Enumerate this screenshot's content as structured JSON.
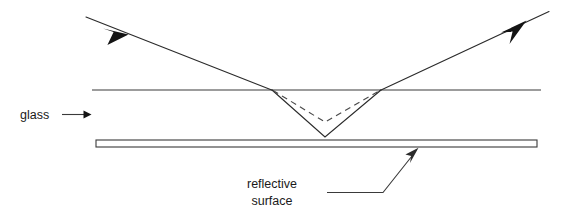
{
  "figure": {
    "background_color": "#ffffff",
    "ink_color": "#2b2b2b",
    "width": 576,
    "height": 223
  },
  "labels": {
    "glass": {
      "text": "glass",
      "x": 20,
      "y": 119,
      "pointer_icon": "arrow-right-icon"
    },
    "reflective_surface": {
      "line1": "reflective",
      "line2": "surface",
      "x": 272,
      "y1": 188,
      "y2": 204,
      "pointer_icon": "arrow-up-right-icon"
    }
  },
  "geometry": {
    "glass_top_surface": {
      "x1": 92,
      "y1": 90,
      "x2": 541,
      "y2": 90
    },
    "mirror_bar": {
      "x": 96,
      "y": 140,
      "width": 441,
      "height": 7
    },
    "incident_ray": {
      "x1": 86,
      "y1": 17,
      "x2": 272,
      "y2": 90
    },
    "exit_ray": {
      "x1": 381,
      "y1": 90,
      "x2": 548,
      "y2": 12
    },
    "refracted_solid": {
      "x1": 272,
      "y1": 90,
      "vx": 325,
      "vy": 137,
      "x2": 381,
      "y2": 90
    },
    "refracted_dashed": {
      "x1": 272,
      "y1": 90,
      "vx": 325,
      "vy": 122,
      "x2": 381,
      "y2": 90
    },
    "incident_arrow_at": {
      "x": 118,
      "y": 30
    },
    "exit_arrow_at": {
      "x": 512,
      "y": 30
    },
    "leader_reflective": {
      "x1": 327,
      "y1": 192,
      "x2": 383,
      "y2": 192,
      "x3": 416,
      "y3": 152
    }
  }
}
